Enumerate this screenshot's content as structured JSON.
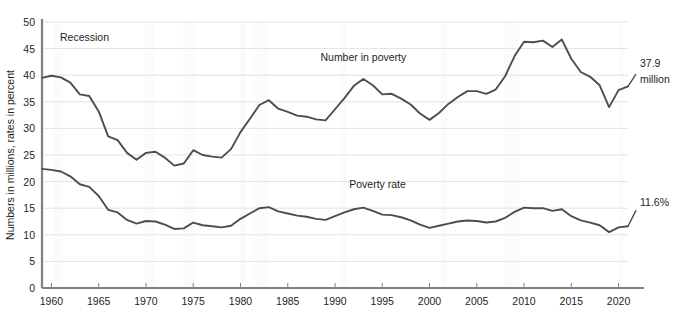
{
  "chart_data": {
    "type": "line",
    "title": "",
    "subtitle": "",
    "xlabel": "",
    "ylabel": "Numbers in millions, rates in percent",
    "xlim": [
      1959,
      2021
    ],
    "ylim": [
      0,
      50
    ],
    "ytick_step": 5,
    "xtick_step": 5,
    "grid": true,
    "grid_axis": "y",
    "legend_position": "inline-annotations",
    "line_color": "#4d4d4d",
    "grid_color": "#e3e3e3",
    "axis_color": "#808080",
    "recession_band_color": "#fbfbfb",
    "yticks": [
      0,
      5,
      10,
      15,
      20,
      25,
      30,
      35,
      40,
      45,
      50
    ],
    "xticks": [
      1960,
      1965,
      1970,
      1975,
      1980,
      1985,
      1990,
      1995,
      2000,
      2005,
      2010,
      2015,
      2020
    ],
    "x": [
      1959,
      1960,
      1961,
      1962,
      1963,
      1964,
      1965,
      1966,
      1967,
      1968,
      1969,
      1970,
      1971,
      1972,
      1973,
      1974,
      1975,
      1976,
      1977,
      1978,
      1979,
      1980,
      1981,
      1982,
      1983,
      1984,
      1985,
      1986,
      1987,
      1988,
      1989,
      1990,
      1991,
      1992,
      1993,
      1994,
      1995,
      1996,
      1997,
      1998,
      1999,
      2000,
      2001,
      2002,
      2003,
      2004,
      2005,
      2006,
      2007,
      2008,
      2009,
      2010,
      2011,
      2012,
      2013,
      2014,
      2015,
      2016,
      2017,
      2018,
      2019,
      2020,
      2021
    ],
    "series": [
      {
        "name": "Number in poverty",
        "unit": "millions",
        "annotation": "Number in poverty",
        "end_label_value": "37.9",
        "end_label_unit": "million",
        "values": [
          39.5,
          39.9,
          39.6,
          38.6,
          36.4,
          36.1,
          33.2,
          28.5,
          27.8,
          25.4,
          24.1,
          25.4,
          25.6,
          24.5,
          23.0,
          23.4,
          25.9,
          25.0,
          24.7,
          24.5,
          26.1,
          29.3,
          31.8,
          34.4,
          35.3,
          33.7,
          33.1,
          32.4,
          32.2,
          31.7,
          31.5,
          33.6,
          35.7,
          38.0,
          39.3,
          38.1,
          36.4,
          36.5,
          35.6,
          34.5,
          32.8,
          31.6,
          32.9,
          34.6,
          35.9,
          37.0,
          37.0,
          36.5,
          37.3,
          39.8,
          43.6,
          46.3,
          46.2,
          46.5,
          45.3,
          46.7,
          43.1,
          40.6,
          39.7,
          38.1,
          34.0,
          37.2,
          37.9
        ]
      },
      {
        "name": "Poverty rate",
        "unit": "percent",
        "annotation": "Poverty rate",
        "end_label_value": "11.6%",
        "end_label_unit": "%",
        "values": [
          22.4,
          22.2,
          21.9,
          21.0,
          19.5,
          19.0,
          17.3,
          14.7,
          14.2,
          12.8,
          12.1,
          12.6,
          12.5,
          11.9,
          11.1,
          11.2,
          12.3,
          11.8,
          11.6,
          11.4,
          11.7,
          13.0,
          14.0,
          15.0,
          15.2,
          14.4,
          14.0,
          13.6,
          13.4,
          13.0,
          12.8,
          13.5,
          14.2,
          14.8,
          15.1,
          14.5,
          13.8,
          13.7,
          13.3,
          12.7,
          11.9,
          11.3,
          11.7,
          12.1,
          12.5,
          12.7,
          12.6,
          12.3,
          12.5,
          13.2,
          14.3,
          15.1,
          15.0,
          15.0,
          14.5,
          14.8,
          13.5,
          12.7,
          12.3,
          11.8,
          10.5,
          11.4,
          11.6
        ]
      }
    ],
    "annotations": [
      {
        "name": "recession",
        "text": "Recession",
        "x": 1963.5,
        "y": 46.5
      },
      {
        "name": "number-in-poverty",
        "text": "Number in poverty",
        "x": 1993.0,
        "y": 42.7
      },
      {
        "name": "poverty-rate",
        "text": "Poverty rate",
        "x": 1994.5,
        "y": 18.8
      },
      {
        "name": "end-value-millions-line1",
        "text": "37.9",
        "x": 2022.0,
        "y": 41.5
      },
      {
        "name": "end-value-millions-line2",
        "text": "million",
        "x": 2022.0,
        "y": 38.6
      },
      {
        "name": "end-value-rate",
        "text": "11.6%",
        "x": 2022.0,
        "y": 15.4
      }
    ],
    "recession_bands": [
      [
        1960.3,
        1961.2
      ],
      [
        1969.9,
        1970.9
      ],
      [
        1973.9,
        1975.2
      ],
      [
        1980.0,
        1980.6
      ],
      [
        1981.5,
        1982.9
      ],
      [
        1990.6,
        1991.2
      ],
      [
        2001.2,
        2001.9
      ],
      [
        2007.9,
        2009.5
      ],
      [
        2020.1,
        2020.5
      ]
    ]
  }
}
